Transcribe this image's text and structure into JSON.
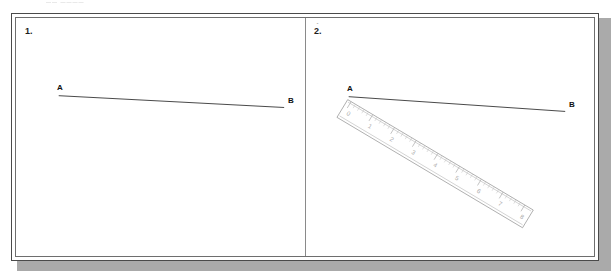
{
  "scan": {
    "header_text": "—— ————"
  },
  "worksheet": {
    "panels": [
      {
        "number": "1.",
        "point_a_label": "A",
        "point_b_label": "B",
        "has_ruler": false,
        "segment": {
          "ax": 43,
          "ay": 79,
          "bx": 270,
          "by": 91
        }
      },
      {
        "number": "2.",
        "point_a_label": "A",
        "point_b_label": "B",
        "has_ruler": true,
        "segment": {
          "ax": 44,
          "ay": 80,
          "bx": 262,
          "by": 95
        },
        "ruler": {
          "unit_labels": [
            "0",
            "1",
            "2",
            "3",
            "4",
            "5",
            "6",
            "7",
            "8"
          ],
          "minor_divisions_per_unit": 5,
          "angle_degrees": 31,
          "length_units": 8
        }
      }
    ],
    "colors": {
      "frame": "#4a4a4a",
      "inner_frame": "#6e6e6e",
      "divider": "#8a8a8a",
      "line": "#333333",
      "ruler_outline": "#9a9a9a",
      "ruler_numerals": "#a8a8a8",
      "shadow": "#8d8d8d",
      "paper": "#ffffff"
    }
  }
}
